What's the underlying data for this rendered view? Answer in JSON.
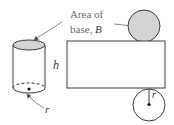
{
  "diagram": {
    "labels": {
      "area_line1": "Area of",
      "area_line2_prefix": "base, ",
      "area_variable": "B",
      "height": "h",
      "radius_cylinder": "r",
      "radius_net": "r"
    },
    "colors": {
      "stroke": "#3a3a3a",
      "base_fill": "#d4d4d4",
      "leader_line": "#8a8a8a",
      "text_gray": "#6b6b6b",
      "text_var": "#333333"
    },
    "shapes": {
      "cylinder": {
        "cx": 29,
        "top_y": 45,
        "bottom_y": 88,
        "rx": 16,
        "ry": 5
      },
      "net_rectangle": {
        "x": 67,
        "y": 41,
        "width": 98,
        "height": 47
      },
      "top_circle": {
        "cx": 144,
        "cy": 26,
        "r": 16
      },
      "bottom_circle": {
        "cx": 149,
        "cy": 105,
        "r": 16
      }
    }
  }
}
